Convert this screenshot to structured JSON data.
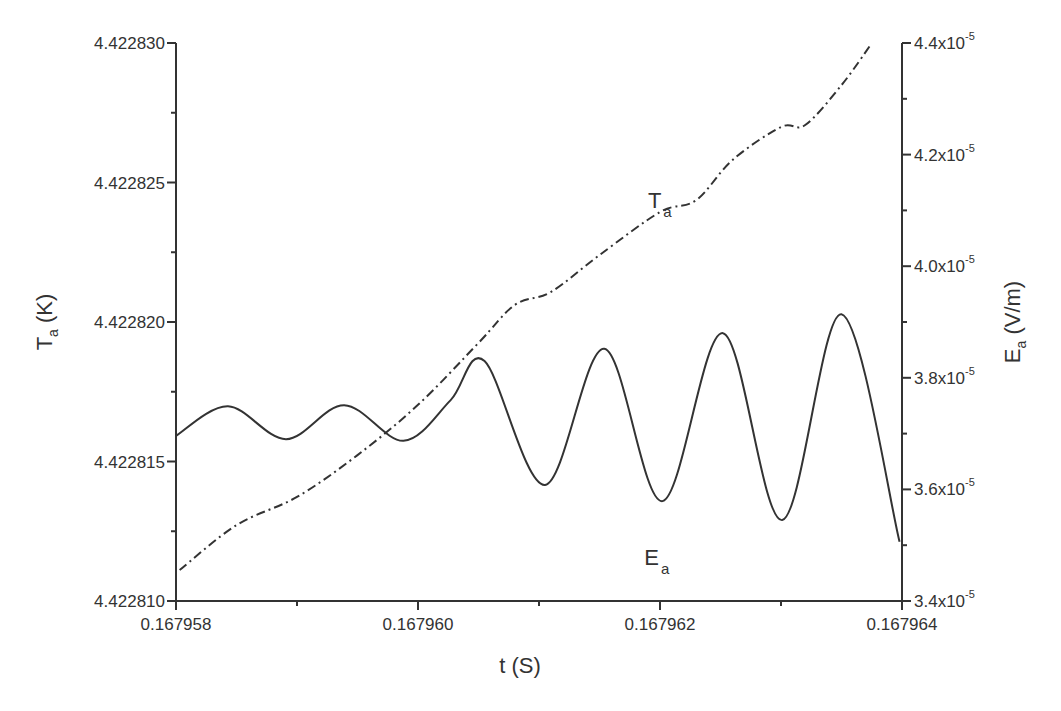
{
  "chart_data": {
    "type": "line",
    "title": "",
    "x_axis": {
      "label": "t (S)",
      "range": [
        0.167958,
        0.167964
      ],
      "major_ticks": [
        0.167958,
        0.16796,
        0.167962,
        0.167964
      ],
      "tick_labels": [
        "0.167958",
        "0.167960",
        "0.167962",
        "0.167964"
      ],
      "minor_ticks": [
        0.167959,
        0.167961,
        0.167963
      ]
    },
    "y_axis_left": {
      "label_main": "T",
      "label_sub": "a",
      "label_unit": " (K)",
      "range": [
        4.42281,
        4.42283
      ],
      "major_ticks": [
        4.42281,
        4.422815,
        4.42282,
        4.422825,
        4.42283
      ],
      "tick_labels": [
        "4.422810",
        "4.422815",
        "4.422820",
        "4.422825",
        "4.422830"
      ],
      "minor_ticks": [
        4.4228125,
        4.4228175,
        4.4228225,
        4.4228275
      ]
    },
    "y_axis_right": {
      "label_main": "E",
      "label_sub": "a",
      "label_unit": " (V/m)",
      "range": [
        3.4e-05,
        4.4e-05
      ],
      "major_ticks": [
        3.4e-05,
        3.6e-05,
        3.8e-05,
        4e-05,
        4.2e-05,
        4.4e-05
      ],
      "tick_labels": [
        {
          "mantissa": "3.4x10",
          "exp": "-5"
        },
        {
          "mantissa": "3.6x10",
          "exp": "-5"
        },
        {
          "mantissa": "3.8x10",
          "exp": "-5"
        },
        {
          "mantissa": "4.0x10",
          "exp": "-5"
        },
        {
          "mantissa": "4.2x10",
          "exp": "-5"
        },
        {
          "mantissa": "4.4x10",
          "exp": "-5"
        }
      ],
      "minor_ticks": [
        3.5e-05,
        3.7e-05,
        3.9e-05,
        4.1e-05,
        4.3e-05
      ]
    },
    "grid": false,
    "series": [
      {
        "name": "T_a",
        "label_main": "T",
        "label_sub": "a",
        "axis": "left",
        "style": "dash-dot",
        "color": "#333333",
        "x": [
          0.16795803,
          0.1679585,
          0.167959,
          0.1679595,
          0.16796,
          0.1679605,
          0.1679608,
          0.1679611,
          0.1679615,
          0.167962,
          0.1679623,
          0.1679626,
          0.167963,
          0.1679632,
          0.1679635,
          0.16796374
        ],
        "y": [
          4.42281111,
          4.42281272,
          4.42281373,
          4.42281523,
          4.42281703,
          4.42281925,
          4.42282061,
          4.42282108,
          4.4228224,
          4.42282394,
          4.42282437,
          4.42282581,
          4.42282699,
          4.42282706,
          4.42282849,
          4.42282993
        ]
      },
      {
        "name": "E_a",
        "label_main": "E",
        "label_sub": "a",
        "axis": "right",
        "style": "solid",
        "color": "#333333",
        "x": [
          0.167958,
          0.16795843,
          0.16795891,
          0.16795939,
          0.16795988,
          0.16796027,
          0.16796055,
          0.16796105,
          0.16796154,
          0.16796202,
          0.16796252,
          0.16796301,
          0.1679635,
          0.16796398
        ],
        "y": [
          3.696e-05,
          3.749e-05,
          3.69e-05,
          3.751e-05,
          3.687e-05,
          3.76e-05,
          3.83e-05,
          3.608e-05,
          3.852e-05,
          3.579e-05,
          3.88e-05,
          3.545e-05,
          3.914e-05,
          3.506e-05
        ]
      }
    ],
    "annotations": [
      {
        "text_main": "T",
        "text_sub": "a",
        "x": 0.1679619,
        "y_left": 4.4228241
      },
      {
        "text_main": "E",
        "text_sub": "a",
        "x": 0.16796187,
        "y_left": 4.4228113
      }
    ],
    "legend": "none"
  }
}
